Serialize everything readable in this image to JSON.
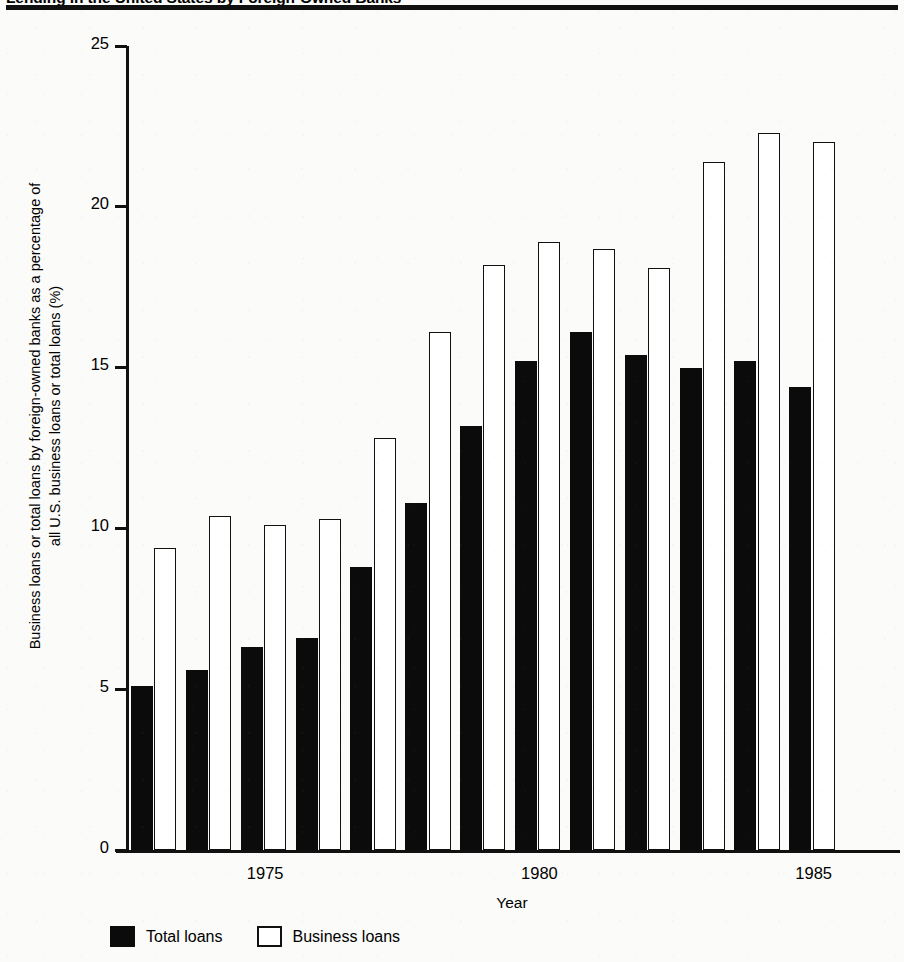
{
  "figure": {
    "title": "Lending in the United States by Foreign-Owned Banks",
    "background_color": "#fbfbf9",
    "ink_color": "#0b0b0b"
  },
  "axes": {
    "y_title_line1": "Business loans or total loans by foreign-owned banks as a percentage of",
    "y_title_line2": "all U.S. business loans or total loans (%)",
    "x_title": "Year",
    "y_ticks": [
      "0",
      "5",
      "10",
      "15",
      "20",
      "25"
    ],
    "x_ticks": [
      "1975",
      "1980",
      "1985"
    ]
  },
  "legend": {
    "items": [
      {
        "label": "Total loans",
        "swatch": "filled",
        "color": "#0b0b0b"
      },
      {
        "label": "Business loans",
        "swatch": "hollow",
        "color": "#ffffff"
      }
    ]
  },
  "chart_data": {
    "type": "bar",
    "title": "Lending in the United States by Foreign-Owned Banks",
    "xlabel": "Year",
    "ylabel": "Business loans or total loans by foreign-owned banks as a percentage of all U.S. business loans or total loans (%)",
    "ylim": [
      0,
      25
    ],
    "yticks": [
      0,
      5,
      10,
      15,
      20,
      25
    ],
    "grid": false,
    "legend_position": "bottom-left",
    "categories": [
      1973,
      1974,
      1975,
      1976,
      1977,
      1978,
      1979,
      1980,
      1981,
      1982,
      1983,
      1984,
      1985,
      1986
    ],
    "xtick_labels": [
      "1975",
      "1980",
      "1985"
    ],
    "series": [
      {
        "name": "Total loans",
        "color": "#0b0b0b",
        "values": [
          5.1,
          5.6,
          6.3,
          6.6,
          8.8,
          10.8,
          13.2,
          15.2,
          16.1,
          15.4,
          15.0,
          15.2,
          14.4,
          null
        ]
      },
      {
        "name": "Business loans",
        "color": "#ffffff",
        "values": [
          9.4,
          10.4,
          10.1,
          10.3,
          12.8,
          16.1,
          18.2,
          18.9,
          18.7,
          18.1,
          21.4,
          22.3,
          22.0,
          null
        ]
      }
    ]
  }
}
